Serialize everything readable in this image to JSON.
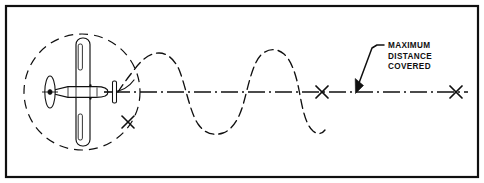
{
  "figure": {
    "background_color": "#ffffff",
    "ink_color": "#101010",
    "frame": {
      "name": "figure-border",
      "x": 6,
      "y": 6,
      "width": 472,
      "height": 171,
      "stroke_width": 2.2
    },
    "centerline": {
      "name": "flight-centerline",
      "label": "flight path centerline",
      "y": 92,
      "x_start": 113,
      "x_end": 468,
      "dash_pattern": "dash-dot"
    },
    "aircraft": {
      "name": "aircraft-plan-view",
      "label": "airplane top view",
      "center_x": 83,
      "center_y": 92,
      "heading": "right",
      "parts": [
        "propeller",
        "spinner",
        "fuselage",
        "wings",
        "horizontal-stabilizer",
        "vertical-fin"
      ]
    },
    "turn_circle": {
      "name": "turn-radius-circle",
      "label": "turning circle",
      "center_x": 82,
      "center_y": 92,
      "radius": 58,
      "dash_pattern": "dashed"
    },
    "wave_path": {
      "name": "oscillating-flight-path",
      "label": "oscillating flight path",
      "x_start": 118,
      "x_end": 322,
      "amplitude": 40,
      "cycles": 2.5,
      "dash_pattern": "dashed"
    },
    "markers": [
      {
        "name": "crash-marker-near",
        "label": "X",
        "x": 128,
        "y": 122,
        "size": 11
      },
      {
        "name": "crash-marker-mid",
        "label": "X",
        "x": 322,
        "y": 92,
        "size": 11
      },
      {
        "name": "crash-marker-far",
        "label": "X",
        "x": 456,
        "y": 92,
        "size": 11
      }
    ],
    "callout": {
      "name": "maximum-distance-callout",
      "lines": [
        "MAXIMUM",
        "DISTANCE",
        "COVERED"
      ],
      "text_x": 388,
      "text_y": 48,
      "line_height": 10.5,
      "leader": {
        "name": "callout-leader-line",
        "from_x": 381,
        "from_y": 45,
        "elbow_x": 375,
        "elbow_y": 47,
        "to_x": 357,
        "to_y": 86
      },
      "arrowhead": {
        "name": "callout-arrowhead",
        "tip_x": 355,
        "tip_y": 93
      }
    }
  }
}
